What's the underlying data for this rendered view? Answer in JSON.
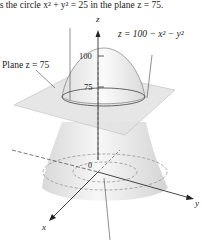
{
  "caption_top": "is the circle x² + y² = 25 in the plane z = 75.",
  "labels": {
    "plane": "Plane z = 75",
    "surface": "z = 100 − x² − y²",
    "z_axis": "z",
    "x_axis": "x",
    "y_axis": "y",
    "tick_100": "100",
    "tick_75": "75",
    "origin": "0"
  },
  "colors": {
    "surface_fill": "#e9e9e9",
    "plane_fill": "#dcdcdc",
    "line": "#333333"
  }
}
